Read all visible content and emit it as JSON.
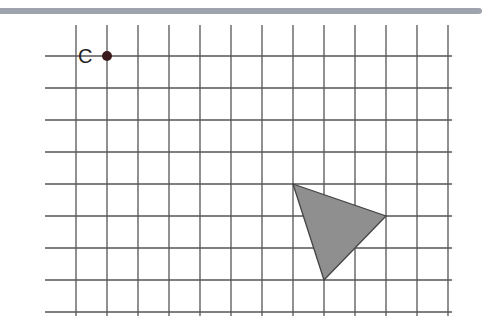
{
  "diagram": {
    "type": "coordinate-grid",
    "grid": {
      "columns": 13,
      "rows": 9,
      "x_lines": [
        76,
        107,
        138,
        169,
        200,
        231,
        262,
        293,
        324,
        355,
        386,
        417,
        448
      ],
      "y_lines": [
        56,
        88,
        120,
        152,
        184,
        216,
        248,
        280,
        312
      ],
      "line_color": "#555555"
    },
    "point": {
      "label": "C",
      "grid_col": 1,
      "grid_row": 0,
      "x": 107,
      "y": 56,
      "color": "#3a1a1a"
    },
    "triangle": {
      "vertices_grid": [
        [
          7,
          4
        ],
        [
          10,
          5
        ],
        [
          8,
          7
        ]
      ],
      "vertices_px": [
        [
          293,
          184
        ],
        [
          386,
          216
        ],
        [
          324,
          280
        ]
      ],
      "fill": "#8f8f8f",
      "stroke": "#444444"
    },
    "header_bar_color": "#9ea3ad"
  }
}
